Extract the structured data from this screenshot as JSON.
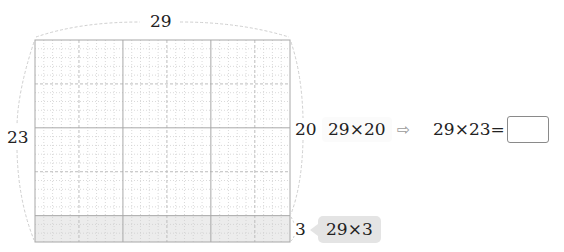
{
  "diagram": {
    "grid": {
      "columns": 29,
      "rows": 23,
      "shaded_rows_from_bottom": 3,
      "major_every": 10,
      "mid_every": 5
    },
    "labels": {
      "top_width": "29",
      "left_height": "23",
      "right_upper_height": "20",
      "right_lower_height": "3"
    },
    "expressions": {
      "upper_part": "29×20",
      "lower_part": "29×3",
      "target": "29×23="
    },
    "answer": {
      "value": ""
    },
    "icons": {
      "implies_arrow": "⇨"
    },
    "colors": {
      "grid_major": "#a8a8a8",
      "grid_minor": "#cfcfcf",
      "shade": "#ececec",
      "chip_bg": "#e4e4e4",
      "bracket": "#c8c8c8"
    }
  }
}
